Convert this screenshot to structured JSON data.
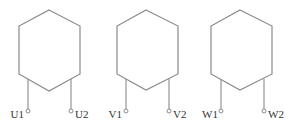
{
  "diagram": {
    "colors": {
      "line": "#8a8a8a",
      "text": "#333333",
      "background": "#ffffff"
    },
    "windings": [
      {
        "name": "U",
        "start_label": "U1",
        "end_label": "U2"
      },
      {
        "name": "V",
        "start_label": "V1",
        "end_label": "V2"
      },
      {
        "name": "W",
        "start_label": "W1",
        "end_label": "W2"
      }
    ]
  }
}
